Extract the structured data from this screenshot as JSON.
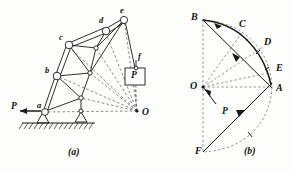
{
  "figure": {
    "panels": [
      {
        "id": "a",
        "caption": "(a)",
        "description": "boom-truss-with-load",
        "applied_load_label": "P",
        "hanging_load_label": "P",
        "pole_label": "O",
        "joint_labels": [
          "a",
          "b",
          "c",
          "d",
          "e",
          "f"
        ],
        "support_types": [
          "pin",
          "roller"
        ]
      },
      {
        "id": "b",
        "caption": "(b)",
        "description": "force-polygon-diagram",
        "pole_label": "O",
        "force_label": "P",
        "vertex_labels": [
          "A",
          "B",
          "C",
          "D",
          "E",
          "F"
        ]
      }
    ]
  },
  "style": {
    "ink": "#1a1a1a",
    "dashed": "#4a4a4a",
    "paper": "#fdfdfc"
  }
}
